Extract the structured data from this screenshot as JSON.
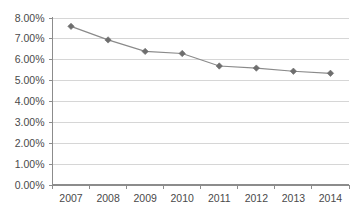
{
  "chart_data": {
    "type": "line",
    "title": "",
    "subtitle": "",
    "xlabel": "",
    "ylabel": "",
    "categories": [
      "2007",
      "2008",
      "2009",
      "2010",
      "2011",
      "2012",
      "2013",
      "2014"
    ],
    "values": [
      7.6,
      6.95,
      6.4,
      6.3,
      5.7,
      5.6,
      5.45,
      5.35
    ],
    "value_format": "percent",
    "ylim": [
      0.0,
      8.0
    ],
    "y_ticks": [
      0.0,
      1.0,
      2.0,
      3.0,
      4.0,
      5.0,
      6.0,
      7.0,
      8.0
    ],
    "y_tick_labels": [
      "0.00%",
      "1.00%",
      "2.00%",
      "3.00%",
      "4.00%",
      "5.00%",
      "6.00%",
      "7.00%",
      "8.00%"
    ],
    "x_tick_labels": [
      "2007",
      "2008",
      "2009",
      "2010",
      "2011",
      "2012",
      "2013",
      "2014"
    ],
    "grid": true,
    "grid_axis": "y",
    "legend": false,
    "legend_position": "none",
    "series": [
      {
        "name": "",
        "marker": "diamond",
        "line_color": "#8a8a8a",
        "marker_color": "#6e6e6e",
        "values": [
          7.6,
          6.95,
          6.4,
          6.3,
          5.7,
          5.6,
          5.45,
          5.35
        ]
      }
    ],
    "colors": {
      "background": "#ffffff",
      "grid": "#d6d6d6",
      "axis": "#8c8c8c",
      "text": "#4a4a4a",
      "line": "#8a8a8a",
      "marker": "#6e6e6e"
    }
  }
}
